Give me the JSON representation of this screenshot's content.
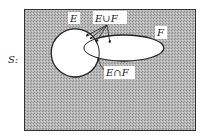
{
  "diagram": {
    "universe_label": "S:",
    "set_e_label": "E",
    "set_f_label": "F",
    "union_label": "E∪F",
    "intersection_label": "E∩F"
  },
  "colors": {
    "background_shading": "#a9a9a9",
    "shading_light": "#d0d0d0",
    "outline": "#222222",
    "set_fill": "#ffffff"
  }
}
